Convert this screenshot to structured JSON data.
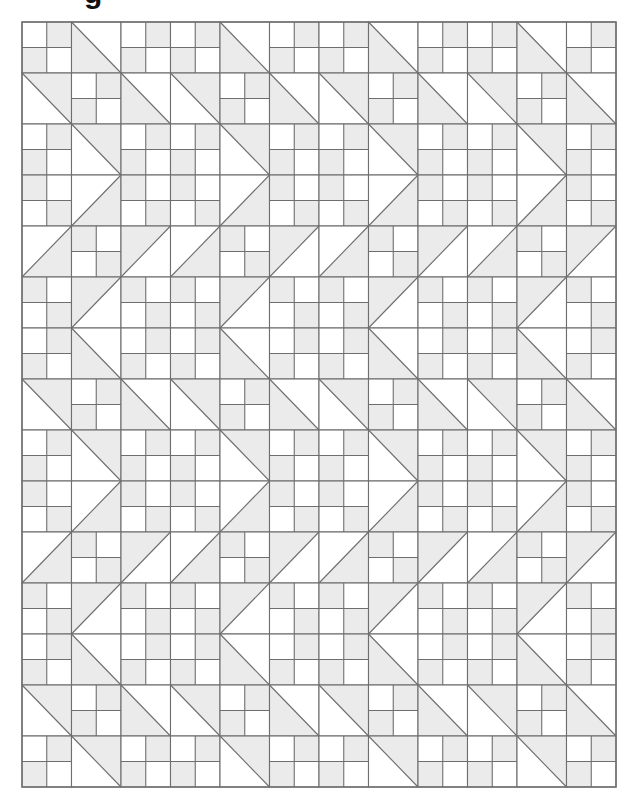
{
  "heading": {
    "visible_text": "g"
  },
  "quilt": {
    "colors": {
      "background": "#ffffff",
      "shade": "#ebebeb",
      "line": "#6e6e6e"
    },
    "grid": {
      "cols": 12,
      "rows": 15,
      "origin_x": 22,
      "origin_y": 22,
      "cell_w": 49.5,
      "cell_h": 51
    },
    "legend": {
      "4patch-a": "four-patch: top-left light, top-right shaded, bottom-left shaded, bottom-right light",
      "4patch-b": "four-patch: top-left shaded, top-right light, bottom-left light, bottom-right shaded",
      "hst-bs-ll": "half-square triangle, diagonal top-left to bottom-right, lower-left shaded",
      "hst-bs-ur": "half-square triangle, diagonal top-left to bottom-right, upper-right shaded",
      "hst-fs-lr": "half-square triangle, diagonal bottom-left to top-right, lower-right shaded",
      "hst-fs-ul": "half-square triangle, diagonal bottom-left to top-right, upper-left shaded"
    },
    "repeat_unit": [
      [
        "4patch-a",
        "hst-bs-ll",
        "4patch-a"
      ],
      [
        "hst-bs-ur",
        "4patch-a",
        "hst-bs-ll"
      ],
      [
        "4patch-a",
        "hst-bs-ur",
        "4patch-a"
      ],
      [
        "4patch-b",
        "hst-fs-lr",
        "4patch-b"
      ],
      [
        "hst-fs-lr",
        "4patch-b",
        "hst-fs-ul"
      ],
      [
        "4patch-b",
        "hst-fs-ul",
        "4patch-b"
      ]
    ]
  }
}
